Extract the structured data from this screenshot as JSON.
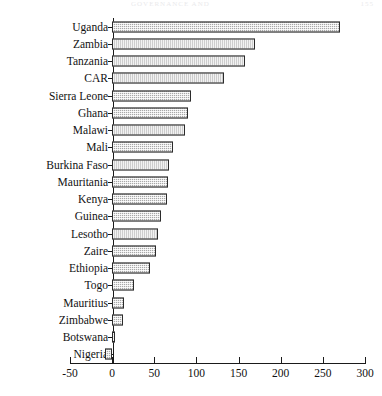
{
  "page": {
    "running_title": "GOVERNANCE AND",
    "folio": "155"
  },
  "chart_data": {
    "type": "bar",
    "orientation": "horizontal",
    "title": "",
    "subtitle": "",
    "xlabel": "",
    "ylabel": "",
    "xlim": [
      -50,
      300
    ],
    "xticks": [
      -50,
      0,
      50,
      100,
      150,
      200,
      250,
      300
    ],
    "xticklabels": [
      "-50",
      "0",
      "50",
      "100",
      "150",
      "200",
      "250",
      "300"
    ],
    "grid": false,
    "legend": false,
    "bar_fill_color": "#a8a8a8",
    "bar_edge_color": "#2b2b2b",
    "categories": [
      "Uganda",
      "Zambia",
      "Tanzania",
      "CAR",
      "Sierra Leone",
      "Ghana",
      "Malawi",
      "Mali",
      "Burkina Faso",
      "Mauritania",
      "Kenya",
      "Guinea",
      "Lesotho",
      "Zaire",
      "Ethiopia",
      "Togo",
      "Mauritius",
      "Zimbabwe",
      "Botswana",
      "Nigeria"
    ],
    "values": [
      270,
      170,
      158,
      133,
      93,
      90,
      87,
      72,
      68,
      66,
      65,
      58,
      55,
      52,
      45,
      26,
      14,
      13,
      3,
      -8
    ]
  }
}
